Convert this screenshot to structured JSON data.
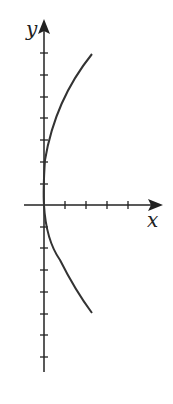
{
  "figure": {
    "x_label": "x",
    "y_label": "y",
    "x_ticks_positive": 4,
    "y_ticks_positive": 7,
    "y_ticks_negative": 7,
    "curve": "sideways parabola through origin opening right",
    "colors": {
      "axis": "#222222",
      "curve": "#333333",
      "background": "#ffffff"
    }
  }
}
